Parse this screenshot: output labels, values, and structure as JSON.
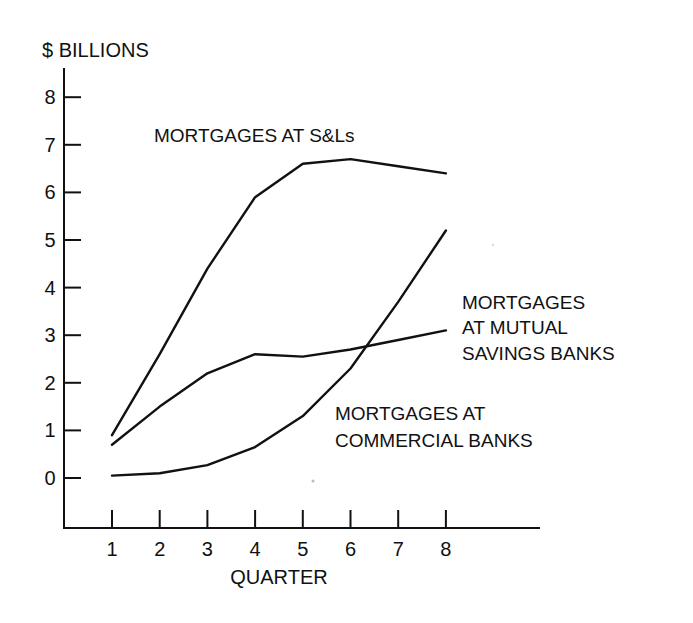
{
  "chart_data": {
    "type": "line",
    "title": "",
    "ylabel": "$ BILLIONS",
    "xlabel": "QUARTER",
    "x": [
      1,
      2,
      3,
      4,
      5,
      6,
      7,
      8
    ],
    "x_tick_labels": [
      "1",
      "2",
      "3",
      "4",
      "5",
      "6",
      "7",
      "8"
    ],
    "y_tick_labels": [
      "0",
      "1",
      "2",
      "3",
      "4",
      "5",
      "6",
      "7",
      "8"
    ],
    "ylim": [
      -1,
      8.6
    ],
    "xlim": [
      0,
      10
    ],
    "grid": false,
    "legend": "none (direct line annotations)",
    "series": [
      {
        "name": "MORTGAGES AT S&Ls",
        "label_lines": [
          "MORTGAGES AT S&Ls"
        ],
        "values": [
          0.9,
          2.6,
          4.4,
          5.9,
          6.6,
          6.7,
          6.55,
          6.4
        ],
        "color": "#111111"
      },
      {
        "name": "MORTGAGES AT MUTUAL SAVINGS BANKS",
        "label_lines": [
          "MORTGAGES",
          "AT MUTUAL",
          "SAVINGS BANKS"
        ],
        "values": [
          0.7,
          1.5,
          2.2,
          2.6,
          2.55,
          2.7,
          2.9,
          3.1
        ],
        "color": "#111111"
      },
      {
        "name": "MORTGAGES AT COMMERCIAL BANKS",
        "label_lines": [
          "MORTGAGES AT",
          "COMMERCIAL BANKS"
        ],
        "values": [
          0.05,
          0.1,
          0.27,
          0.65,
          1.3,
          2.3,
          3.7,
          5.2
        ],
        "color": "#111111"
      }
    ]
  }
}
